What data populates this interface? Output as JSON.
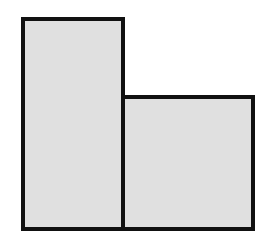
{
  "diagram": {
    "shapes": [
      {
        "id": "tall-rectangle",
        "x": 21,
        "y": 17,
        "width": 104,
        "height": 214,
        "fill": "#e0e0e0",
        "stroke": "#111111",
        "stroke_width": 4
      },
      {
        "id": "short-rectangle",
        "x": 121,
        "y": 95,
        "width": 134,
        "height": 136,
        "fill": "#e0e0e0",
        "stroke": "#111111",
        "stroke_width": 4
      }
    ],
    "background": "#ffffff"
  }
}
